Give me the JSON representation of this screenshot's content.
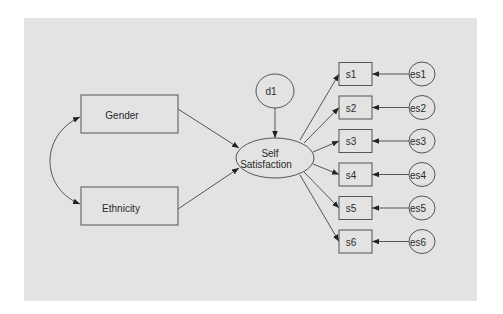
{
  "diagram": {
    "type": "structural-equation-model",
    "colors": {
      "panel": "#e3e3e3",
      "stroke": "#555555",
      "text": "#2a2a2a",
      "background": "#ffffff"
    },
    "nodes": {
      "gender": {
        "label": "Gender",
        "shape": "rectangle",
        "kind": "observed-exogenous"
      },
      "ethnicity": {
        "label": "Ethnicity",
        "shape": "rectangle",
        "kind": "observed-exogenous"
      },
      "self_satisfaction": {
        "label_line1": "Self",
        "label_line2": "Satisfaction",
        "shape": "ellipse",
        "kind": "latent"
      },
      "d1": {
        "label": "d1",
        "shape": "circle",
        "kind": "disturbance"
      },
      "indicators": [
        {
          "label": "s1",
          "error": "es1"
        },
        {
          "label": "s2",
          "error": "es2"
        },
        {
          "label": "s3",
          "error": "es3"
        },
        {
          "label": "s4",
          "error": "es4"
        },
        {
          "label": "s5",
          "error": "es5"
        },
        {
          "label": "s6",
          "error": "es6"
        }
      ]
    },
    "edges": [
      {
        "from": "Gender",
        "to": "Self Satisfaction",
        "type": "directed"
      },
      {
        "from": "Ethnicity",
        "to": "Self Satisfaction",
        "type": "directed"
      },
      {
        "from": "Gender",
        "to": "Ethnicity",
        "type": "covariance-bidirectional"
      },
      {
        "from": "d1",
        "to": "Self Satisfaction",
        "type": "directed"
      },
      {
        "from": "Self Satisfaction",
        "to": "s1",
        "type": "directed"
      },
      {
        "from": "Self Satisfaction",
        "to": "s2",
        "type": "directed"
      },
      {
        "from": "Self Satisfaction",
        "to": "s3",
        "type": "directed"
      },
      {
        "from": "Self Satisfaction",
        "to": "s4",
        "type": "directed"
      },
      {
        "from": "Self Satisfaction",
        "to": "s5",
        "type": "directed"
      },
      {
        "from": "Self Satisfaction",
        "to": "s6",
        "type": "directed"
      },
      {
        "from": "es1",
        "to": "s1",
        "type": "directed"
      },
      {
        "from": "es2",
        "to": "s2",
        "type": "directed"
      },
      {
        "from": "es3",
        "to": "s3",
        "type": "directed"
      },
      {
        "from": "es4",
        "to": "s4",
        "type": "directed"
      },
      {
        "from": "es5",
        "to": "s5",
        "type": "directed"
      },
      {
        "from": "es6",
        "to": "s6",
        "type": "directed"
      }
    ]
  }
}
